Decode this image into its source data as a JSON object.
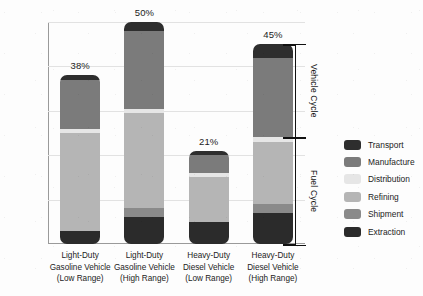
{
  "chart_data": {
    "type": "bar",
    "subtype": "stacked-bar",
    "title": "",
    "xlabel": "",
    "ylabel": "",
    "ylim": [
      0,
      50
    ],
    "yunit": "%",
    "grid": true,
    "legend_position": "right",
    "ytick_labels": [
      "0%",
      "10%",
      "20%",
      "30%",
      "40%",
      "50%"
    ],
    "ytick_values": [
      0,
      10,
      20,
      30,
      40,
      50
    ],
    "categories": [
      "Light-Duty Gasoline Vehicle (Low Range)",
      "Light-Duty Gasoline Vehicle (High Range)",
      "Heavy-Duty Diesel Vehicle (Low Range)",
      "Heavy-Duty Diesel Vehicle (High Range)"
    ],
    "category_lines": [
      [
        "Light-Duty",
        "Gasoline Vehicle",
        "(Low Range)"
      ],
      [
        "Light-Duty",
        "Gasoline Vehicle",
        "(High Range)"
      ],
      [
        "Heavy-Duty",
        "Diesel Vehicle",
        "(Low Range)"
      ],
      [
        "Heavy-Duty",
        "Diesel Vehicle",
        "(High Range)"
      ]
    ],
    "totals": [
      38,
      50,
      21,
      45
    ],
    "total_labels": [
      "38%",
      "50%",
      "21%",
      "45%"
    ],
    "series": [
      {
        "name": "Extraction",
        "color": "#2b2b2b",
        "cycle": "Fuel Cycle",
        "values": [
          3.0,
          6.0,
          5.0,
          7.0
        ]
      },
      {
        "name": "Shipment",
        "color": "#8a8a8a",
        "cycle": "Fuel Cycle",
        "values": [
          0.0,
          2.0,
          0.0,
          2.0
        ]
      },
      {
        "name": "Refining",
        "color": "#b5b5b5",
        "cycle": "Fuel Cycle",
        "values": [
          22.0,
          21.5,
          10.0,
          14.0
        ]
      },
      {
        "name": "Distribution",
        "color": "#e6e6e6",
        "cycle": "Fuel Cycle",
        "values": [
          1.0,
          1.0,
          1.0,
          1.0
        ]
      },
      {
        "name": "Manufacture",
        "color": "#7b7b7b",
        "cycle": "Vehicle Cycle",
        "values": [
          11.0,
          17.5,
          4.0,
          18.0
        ]
      },
      {
        "name": "Transport",
        "color": "#2e2e2e",
        "cycle": "Vehicle Cycle",
        "values": [
          1.0,
          2.0,
          1.0,
          3.0
        ]
      }
    ],
    "stack_order_bottom_to_top": [
      "Extraction",
      "Shipment",
      "Refining",
      "Distribution",
      "Manufacture",
      "Transport"
    ],
    "annotations": [
      {
        "name": "vehicle-cycle-bracket",
        "label": "Vehicle Cycle",
        "from_percent": 24,
        "to_percent": 45
      },
      {
        "name": "fuel-cycle-bracket",
        "label": "Fuel Cycle",
        "from_percent": 0,
        "to_percent": 24
      }
    ]
  },
  "legend": {
    "items": [
      {
        "label": "Transport",
        "color": "#2e2e2e"
      },
      {
        "label": "Manufacture",
        "color": "#7b7b7b"
      },
      {
        "label": "Distribution",
        "color": "#e6e6e6"
      },
      {
        "label": "Refining",
        "color": "#b5b5b5"
      },
      {
        "label": "Shipment",
        "color": "#8a8a8a"
      },
      {
        "label": "Extraction",
        "color": "#2b2b2b"
      }
    ]
  }
}
